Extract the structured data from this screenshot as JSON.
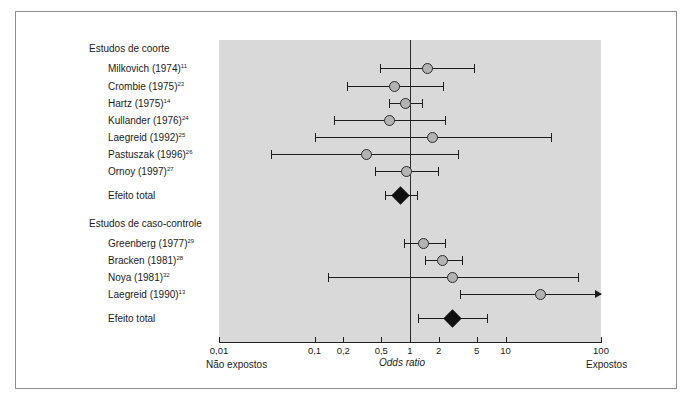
{
  "figure": {
    "axis_title": "Odds ratio",
    "left_direction_label": "Não expostos",
    "right_direction_label": "Expostos",
    "total_effect_label": "Efeito total",
    "panel_color": "#d9d9d9",
    "marker_color": "#b3b3b3",
    "line_color": "#1c1c1c"
  },
  "groups": [
    {
      "name": "Estudos de coorte"
    },
    {
      "name": "Estudos de caso-controle"
    }
  ],
  "axis": {
    "ticks": [
      "0,01",
      "0,1",
      "0,2",
      "0,5",
      "1",
      "2",
      "5",
      "10",
      "100"
    ],
    "tick_values": [
      0.01,
      0.1,
      0.2,
      0.5,
      1,
      2,
      5,
      10,
      100
    ],
    "min": 0.01,
    "max": 100,
    "scale": "log10",
    "reference_value": 1
  },
  "chart_data": {
    "type": "forest",
    "title": "",
    "xlabel": "Odds ratio",
    "ylabel": "",
    "xscale": "log",
    "xlim": [
      0.01,
      100
    ],
    "xticks": [
      0.01,
      0.1,
      0.2,
      0.5,
      1,
      2,
      5,
      10,
      100
    ],
    "xticklabels": [
      "0,01",
      "0,1",
      "0,2",
      "0,5",
      "1",
      "2",
      "5",
      "10",
      "100"
    ],
    "reference_line": 1,
    "grid": false,
    "legend": "none",
    "annotations": {
      "left": "Não expostos",
      "right": "Expostos",
      "center": "Odds ratio"
    },
    "groups": [
      {
        "name": "Estudos de coorte",
        "rows": [
          {
            "label": "Milkovich (1974)",
            "ref": "11",
            "or": 1.54,
            "low": 0.49,
            "high": 4.7,
            "type": "study"
          },
          {
            "label": "Crombie (1975)",
            "ref": "23",
            "or": 0.69,
            "low": 0.22,
            "high": 2.2,
            "type": "study"
          },
          {
            "label": "Hartz (1975)",
            "ref": "14",
            "or": 0.89,
            "low": 0.6,
            "high": 1.35,
            "type": "study"
          },
          {
            "label": "Kullander (1976)",
            "ref": "24",
            "or": 0.61,
            "low": 0.16,
            "high": 2.3,
            "type": "study"
          },
          {
            "label": "Laegreid (1992)",
            "ref": "25",
            "or": 1.7,
            "low": 0.1,
            "high": 30.0,
            "type": "study"
          },
          {
            "label": "Pastuszak (1996)",
            "ref": "26",
            "or": 0.35,
            "low": 0.035,
            "high": 3.2,
            "type": "study"
          },
          {
            "label": "Ornoy (1997)",
            "ref": "27",
            "or": 0.91,
            "low": 0.43,
            "high": 1.95,
            "type": "study"
          },
          {
            "label": "Efeito total",
            "ref": "",
            "or": 0.79,
            "low": 0.55,
            "high": 1.18,
            "type": "summary"
          }
        ]
      },
      {
        "name": "Estudos de caso-controle",
        "rows": [
          {
            "label": "Greenberg (1977)",
            "ref": "29",
            "or": 1.4,
            "low": 0.87,
            "high": 2.3,
            "type": "study"
          },
          {
            "label": "Bracken (1981)",
            "ref": "28",
            "or": 2.2,
            "low": 1.45,
            "high": 3.5,
            "type": "study"
          },
          {
            "label": "Noya (1981)",
            "ref": "32",
            "or": 2.8,
            "low": 0.14,
            "high": 58.0,
            "type": "study"
          },
          {
            "label": "Laegreid (1990)",
            "ref": "13",
            "or": 23.0,
            "low": 3.3,
            "high": 100,
            "type": "study",
            "right_arrow": true
          },
          {
            "label": "Efeito total",
            "ref": "",
            "or": 2.8,
            "low": 1.2,
            "high": 6.4,
            "type": "summary"
          }
        ]
      }
    ]
  }
}
